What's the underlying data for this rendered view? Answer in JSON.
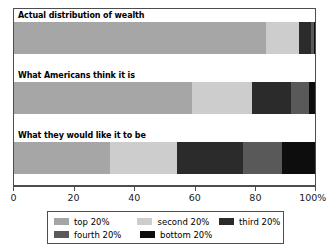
{
  "chart_data": {
    "type": "bar",
    "orientation": "horizontal",
    "stacked": true,
    "normalized_percent": true,
    "title": "",
    "subtitle": "",
    "xlabel": "",
    "ylabel": "",
    "xlim": [
      0,
      100
    ],
    "grid": false,
    "legend_position": "bottom",
    "categories": [
      "Actual distribution of wealth",
      "What Americans think it is",
      "What they would like it to be"
    ],
    "series": [
      {
        "name": "top 20%",
        "color": "#a6a6a6",
        "values": [
          84.0,
          59.0,
          32.0
        ]
      },
      {
        "name": "second 20%",
        "color": "#cdcdcd",
        "values": [
          11.0,
          20.0,
          22.0
        ]
      },
      {
        "name": "third 20%",
        "color": "#2b2b2b",
        "values": [
          4.0,
          13.0,
          22.0
        ]
      },
      {
        "name": "fourth 20%",
        "color": "#595959",
        "values": [
          1.0,
          6.0,
          13.0
        ]
      },
      {
        "name": "bottom 20%",
        "color": "#0d0d0d",
        "values": [
          0.5,
          2.0,
          11.0
        ]
      }
    ],
    "xticks": [
      0,
      20,
      40,
      60,
      80,
      100
    ],
    "xtick_labels": [
      "0",
      "20",
      "40",
      "60",
      "80",
      "100%"
    ]
  },
  "legend": {
    "rows": [
      [
        {
          "label": "top 20%",
          "color": "#a6a6a6"
        },
        {
          "label": "second 20%",
          "color": "#cdcdcd"
        },
        {
          "label": "third 20%",
          "color": "#2b2b2b"
        }
      ],
      [
        {
          "label": "fourth 20%",
          "color": "#595959"
        },
        {
          "label": "bottom 20%",
          "color": "#0d0d0d"
        }
      ]
    ]
  },
  "colors": {
    "frame": "#4d4d4d",
    "background": "#ffffff",
    "text": "#000000"
  }
}
